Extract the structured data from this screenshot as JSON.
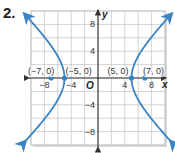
{
  "problem_number": "2.",
  "colors": {
    "curve": "#3a84c4",
    "grid": "#c8c8c8",
    "axis": "#333333",
    "point": "#3a84c4"
  },
  "chart_data": {
    "type": "line",
    "title": "",
    "xlabel": "x",
    "ylabel": "y",
    "origin_label": "O",
    "xlim": [
      -10,
      10
    ],
    "ylim": [
      -10,
      10
    ],
    "grid": true,
    "grid_step": 2,
    "x_ticks": [
      {
        "value": -8,
        "label": "−8"
      },
      {
        "value": -4,
        "label": "−4"
      },
      {
        "value": 4,
        "label": "4"
      },
      {
        "value": 8,
        "label": "8"
      }
    ],
    "y_ticks": [
      {
        "value": 8,
        "label": "8"
      },
      {
        "value": 4,
        "label": "4"
      },
      {
        "value": -4,
        "label": "−4"
      },
      {
        "value": -8,
        "label": "−8"
      }
    ],
    "series": [
      {
        "name": "hyperbola",
        "equation": "x^2/25 - y^2/24 = 1",
        "a": 5,
        "b": 4.899
      }
    ],
    "points": [
      {
        "x": -7,
        "y": 0,
        "label": "(−7, 0)"
      },
      {
        "x": -5,
        "y": 0,
        "label": "(−5, 0)"
      },
      {
        "x": 5,
        "y": 0,
        "label": "(5, 0)"
      },
      {
        "x": 7,
        "y": 0,
        "label": "(7, 0)"
      }
    ]
  }
}
